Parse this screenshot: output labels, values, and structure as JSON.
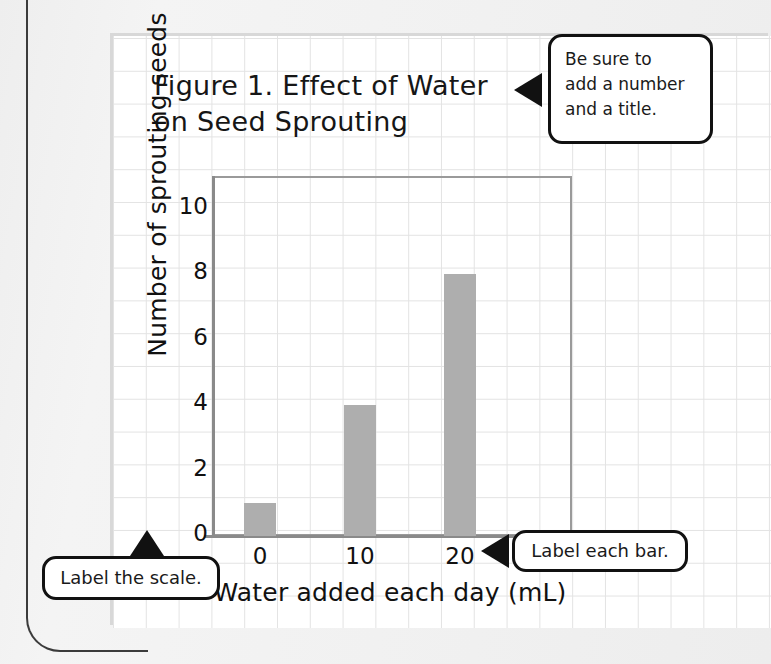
{
  "figure": {
    "title": "Figure 1. Effect of Water\non Seed Sprouting"
  },
  "callouts": {
    "title_hint": "Be sure to\nadd a number\nand a title.",
    "scale_hint": "Label the scale.",
    "bar_hint": "Label each bar."
  },
  "chart_data": {
    "type": "bar",
    "title": "Figure 1. Effect of Water on Seed Sprouting",
    "categories": [
      "0",
      "10",
      "20"
    ],
    "values": [
      1,
      4,
      8
    ],
    "xlabel": "Water added each day (mL)",
    "ylabel": "Number of sprouting seeds",
    "ylim": [
      0,
      11
    ],
    "yticks": [
      "0",
      "2",
      "4",
      "6",
      "8",
      "10"
    ],
    "ytick_values": [
      0,
      2,
      4,
      6,
      8,
      10
    ],
    "grid": true,
    "legend": null,
    "bar_color": "#aeaeae",
    "frame_color": "#9a9a9a",
    "series": [
      {
        "name": "Number of sprouting seeds",
        "values": [
          1,
          4,
          8
        ]
      }
    ]
  },
  "colors": {
    "bar_fill": "#aeaeae",
    "axis": "#8a8a8a",
    "grid_line": "#e3e3e3",
    "ink": "#111111",
    "page_bg": "#f0f0f0",
    "paper": "#ffffff"
  }
}
